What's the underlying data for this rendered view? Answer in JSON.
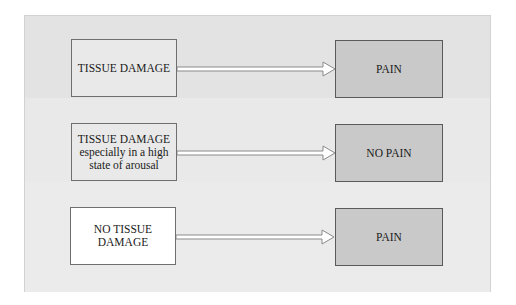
{
  "diagram": {
    "rows": [
      {
        "cause": "TISSUE DAMAGE",
        "cause_lines": [
          "TISSUE DAMAGE"
        ],
        "cause_fill": "#e9e9e9",
        "effect": "PAIN"
      },
      {
        "cause": "TISSUE DAMAGE especially in a high state of arousal",
        "cause_lines": [
          "TISSUE DAMAGE",
          "especially in a high",
          "state of arousal"
        ],
        "cause_fill": "#e9e9e9",
        "effect": "NO PAIN"
      },
      {
        "cause": "NO TISSUE DAMAGE",
        "cause_lines": [
          "NO TISSUE",
          "DAMAGE"
        ],
        "cause_fill": "#ffffff",
        "effect": "PAIN"
      }
    ],
    "colors": {
      "frame_background": "#e7e7e7",
      "effect_box_fill": "#c9c9c9",
      "box_border": "#6f6f6f",
      "arrow_fill": "#ffffff",
      "arrow_outline": "#8a8a8a"
    }
  }
}
